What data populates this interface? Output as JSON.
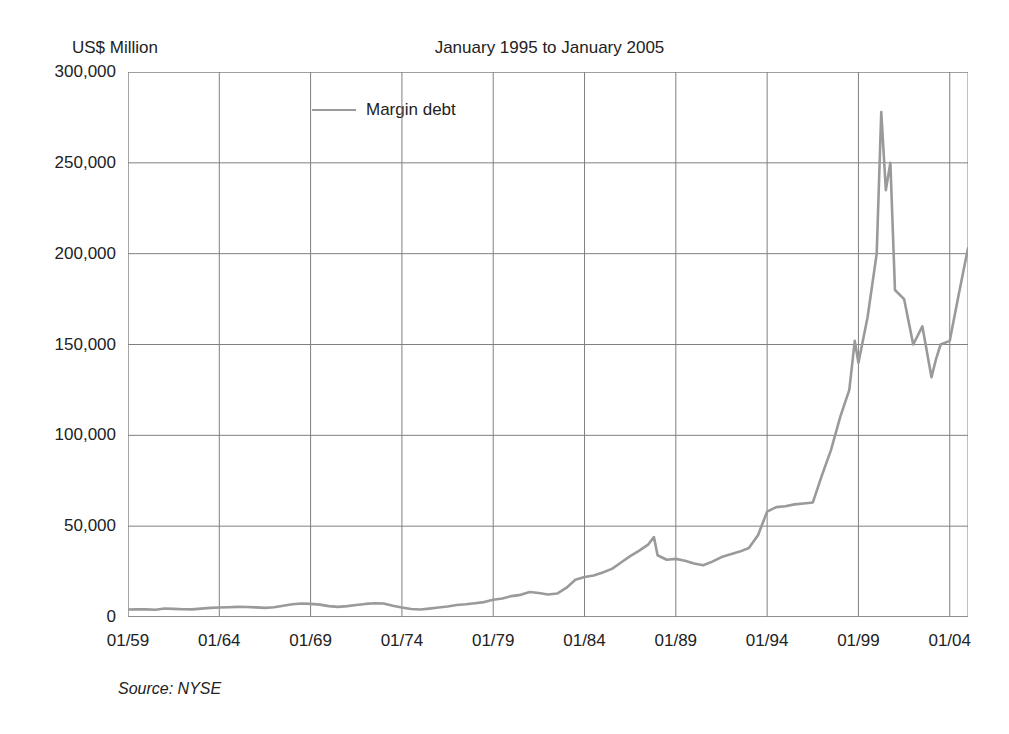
{
  "header": {
    "title": "January 1995 to January 2005",
    "y_axis_caption": "US$ Million"
  },
  "legend": {
    "entries": [
      {
        "label": "Margin debt",
        "color": "#9a9a9a"
      }
    ]
  },
  "footer": {
    "source": "Source: NYSE"
  },
  "colors": {
    "series_line": "#9a9a9a",
    "grid": "#808080",
    "axis": "#808080",
    "text": "#222222",
    "background": "#ffffff"
  },
  "chart_data": {
    "type": "line",
    "title": "January 1995 to January 2005",
    "xlabel": "",
    "ylabel": "US$ Million",
    "ylim": [
      0,
      300000
    ],
    "yticks": [
      0,
      50000,
      100000,
      150000,
      200000,
      250000,
      300000
    ],
    "ytick_labels": [
      "0",
      "50,000",
      "100,000",
      "150,000",
      "200,000",
      "250,000",
      "300,000"
    ],
    "xticks": [
      "01/59",
      "01/64",
      "01/69",
      "01/74",
      "01/79",
      "01/84",
      "01/89",
      "01/94",
      "01/99",
      "01/04"
    ],
    "xlim": [
      "01/59",
      "01/05"
    ],
    "grid": true,
    "legend_position": "inside-top-left",
    "series": [
      {
        "name": "Margin debt",
        "color": "#9a9a9a",
        "x": [
          "1959.0",
          "1959.5",
          "1960.0",
          "1960.5",
          "1961.0",
          "1961.5",
          "1962.0",
          "1962.5",
          "1963.0",
          "1963.5",
          "1964.0",
          "1964.5",
          "1965.0",
          "1965.5",
          "1966.0",
          "1966.5",
          "1967.0",
          "1967.5",
          "1968.0",
          "1968.5",
          "1969.0",
          "1969.5",
          "1970.0",
          "1970.5",
          "1971.0",
          "1971.5",
          "1972.0",
          "1972.5",
          "1973.0",
          "1973.5",
          "1974.0",
          "1974.5",
          "1975.0",
          "1975.5",
          "1976.0",
          "1976.5",
          "1977.0",
          "1977.5",
          "1978.0",
          "1978.5",
          "1979.0",
          "1979.5",
          "1980.0",
          "1980.5",
          "1981.0",
          "1981.5",
          "1982.0",
          "1982.5",
          "1983.0",
          "1983.5",
          "1984.0",
          "1984.5",
          "1985.0",
          "1985.5",
          "1986.0",
          "1986.5",
          "1987.0",
          "1987.5",
          "1987.8",
          "1988.0",
          "1988.5",
          "1989.0",
          "1989.5",
          "1990.0",
          "1990.5",
          "1991.0",
          "1991.5",
          "1992.0",
          "1992.5",
          "1993.0",
          "1993.5",
          "1994.0",
          "1994.5",
          "1995.0",
          "1995.5",
          "1996.0",
          "1996.5",
          "1997.0",
          "1997.5",
          "1998.0",
          "1998.5",
          "1998.8",
          "1999.0",
          "1999.5",
          "2000.0",
          "2000.25",
          "2000.5",
          "2000.75",
          "2001.0",
          "2001.5",
          "2002.0",
          "2002.5",
          "2003.0",
          "2003.25",
          "2003.5",
          "2004.0",
          "2004.5",
          "2005.0"
        ],
        "values": [
          4100,
          4300,
          4200,
          4000,
          4700,
          4500,
          4300,
          4200,
          4600,
          5000,
          5200,
          5400,
          5600,
          5500,
          5300,
          5000,
          5400,
          6200,
          7000,
          7400,
          7200,
          6800,
          6000,
          5600,
          6000,
          6600,
          7200,
          7600,
          7400,
          6200,
          5200,
          4400,
          4100,
          4600,
          5200,
          5800,
          6600,
          7000,
          7600,
          8200,
          9500,
          10200,
          11500,
          12200,
          13800,
          13200,
          12400,
          12900,
          16000,
          20500,
          22000,
          22800,
          24500,
          26500,
          30000,
          33500,
          36500,
          40000,
          44000,
          34000,
          31500,
          32000,
          31000,
          29500,
          28500,
          30500,
          33000,
          34500,
          36000,
          38000,
          45000,
          58000,
          60500,
          61000,
          62000,
          62500,
          63000,
          78000,
          92000,
          110000,
          125000,
          152000,
          140000,
          165000,
          200000,
          278000,
          235000,
          250000,
          180000,
          175000,
          150000,
          160000,
          132000,
          142000,
          150000,
          152000,
          178000,
          203000
        ]
      }
    ],
    "annotations": {
      "peak_value": 278000,
      "peak_date": "2000.25",
      "trough_after_peak": 132000,
      "final_value": 203000,
      "start_value": 4100
    }
  }
}
